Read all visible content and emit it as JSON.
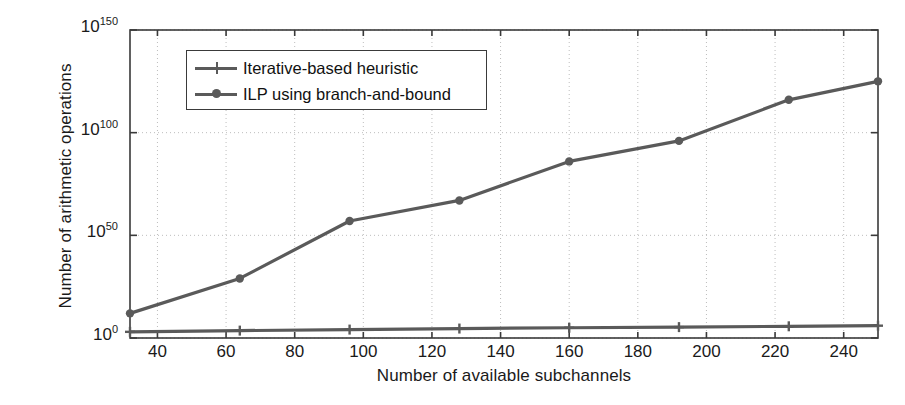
{
  "chart_data": {
    "type": "line",
    "title": "",
    "xlabel": "Number of available subchannels",
    "ylabel": "Number of arithmetic operations",
    "yscale": "log",
    "xlim": [
      32,
      250
    ],
    "ylim": [
      1,
      1e+150
    ],
    "grid": true,
    "legend_position": "upper left",
    "xticks": [
      40,
      60,
      80,
      100,
      120,
      140,
      160,
      180,
      200,
      220,
      240
    ],
    "ytick_labels": [
      "10^0",
      "10^50",
      "10^100",
      "10^150"
    ],
    "ytick_mantissa": "10",
    "ytick_exponents": [
      "0",
      "50",
      "100",
      "150"
    ],
    "x": [
      32,
      64,
      96,
      128,
      160,
      192,
      224,
      250
    ],
    "series": [
      {
        "name": "Iterative-based heuristic",
        "marker": "plus",
        "color": "#5a5a5a",
        "exponents": [
          3.0,
          3.6,
          4.1,
          4.6,
          5.0,
          5.3,
          5.7,
          6.0
        ]
      },
      {
        "name": "ILP using branch-and-bound",
        "marker": "circle",
        "color": "#5a5a5a",
        "exponents": [
          12.0,
          29.0,
          57.0,
          67.0,
          86.0,
          96.0,
          116.0,
          125.0
        ]
      }
    ]
  },
  "axis": {
    "frame_color": "#3a3a3a",
    "grid_color": "#bdbdbd",
    "background": "#ffffff"
  },
  "legend": {
    "items": [
      {
        "label": "Iterative-based heuristic",
        "marker": "plus-marker"
      },
      {
        "label": "ILP using branch-and-bound",
        "marker": "circle-marker"
      }
    ]
  }
}
